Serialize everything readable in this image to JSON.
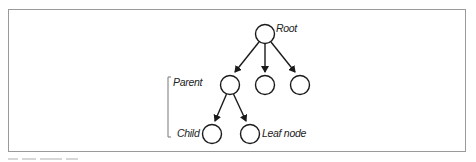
{
  "figure": {
    "type": "tree-diagram",
    "nodes": [
      {
        "id": "root",
        "label": "Root",
        "cx": 265,
        "cy": 35
      },
      {
        "id": "parent",
        "label": "",
        "cx": 230,
        "cy": 85
      },
      {
        "id": "mid",
        "label": "",
        "cx": 265,
        "cy": 85
      },
      {
        "id": "right",
        "label": "",
        "cx": 300,
        "cy": 85
      },
      {
        "id": "child",
        "label": "",
        "cx": 212,
        "cy": 134
      },
      {
        "id": "leaf",
        "label": "",
        "cx": 250,
        "cy": 134
      }
    ],
    "edges": [
      {
        "from": "root",
        "to": "parent"
      },
      {
        "from": "root",
        "to": "mid"
      },
      {
        "from": "root",
        "to": "right"
      },
      {
        "from": "parent",
        "to": "child"
      },
      {
        "from": "parent",
        "to": "leaf"
      }
    ],
    "labels": {
      "root": "Root",
      "parent": "Parent",
      "child": "Child",
      "leaf": "Leaf node"
    },
    "colors": {
      "stroke": "#1a1a1a",
      "frame": "#9a9a9a",
      "bracket": "#777777"
    }
  }
}
